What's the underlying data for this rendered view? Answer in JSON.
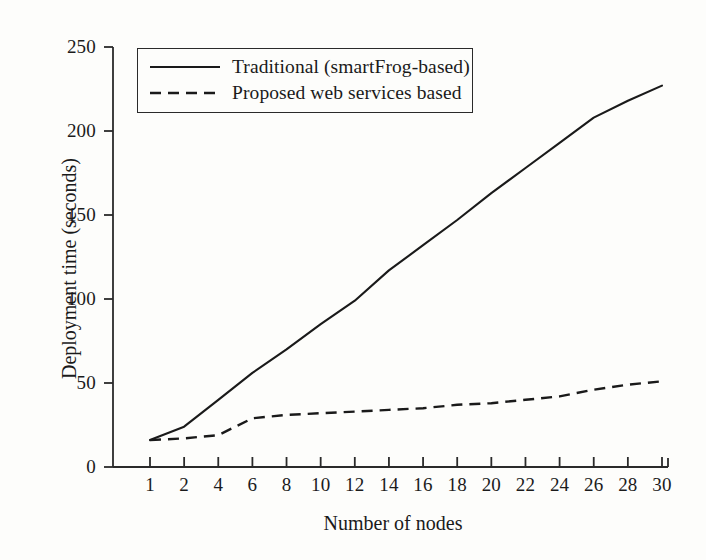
{
  "chart_data": {
    "type": "line",
    "title": "",
    "xlabel": "Number of nodes",
    "ylabel": "Deployment time (seconds)",
    "x_tick_labels": [
      "1",
      "2",
      "4",
      "6",
      "8",
      "10",
      "12",
      "14",
      "16",
      "18",
      "20",
      "22",
      "24",
      "26",
      "28",
      "30"
    ],
    "x": [
      1,
      2,
      4,
      6,
      8,
      10,
      12,
      14,
      16,
      18,
      20,
      22,
      24,
      26,
      28,
      30
    ],
    "x_scale": "categorical-evenly-spaced",
    "ylim": [
      0,
      250
    ],
    "y_ticks": [
      0,
      50,
      100,
      150,
      200,
      250
    ],
    "grid": false,
    "legend_position": "top-left",
    "series": [
      {
        "name": "Traditional (smartFrog-based)",
        "style": "solid",
        "color": "#1a1a1a",
        "values": [
          16,
          24,
          40,
          56,
          70,
          85,
          99,
          117,
          132,
          147,
          163,
          178,
          193,
          208,
          218,
          227
        ]
      },
      {
        "name": "Proposed web services based",
        "style": "dashed",
        "color": "#1a1a1a",
        "values": [
          16,
          17,
          19,
          29,
          31,
          32,
          33,
          34,
          35,
          37,
          38,
          40,
          42,
          46,
          49,
          51
        ]
      }
    ]
  },
  "axes": {
    "y_tick_labels": [
      "250",
      "200",
      "150",
      "100",
      "50",
      "0"
    ],
    "y_title": "Deployment time (seconds)",
    "x_title": "Number of nodes"
  },
  "legend": {
    "items": [
      {
        "label": "Traditional (smartFrog-based)",
        "style": "solid"
      },
      {
        "label": "Proposed web services based",
        "style": "dashed"
      }
    ]
  },
  "colors": {
    "ink": "#1a1a1a",
    "background": "#fdfdfb",
    "axis": "#2a2a2a"
  }
}
